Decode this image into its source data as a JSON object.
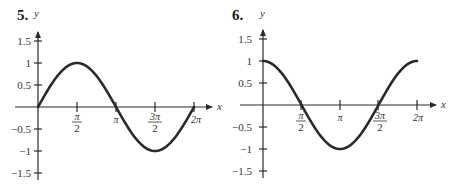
{
  "chart_data": [
    {
      "type": "line",
      "problem_number": "5.",
      "title": "",
      "xlabel": "x",
      "ylabel": "y",
      "x_ticks": [
        "π/2",
        "π",
        "3π/2",
        "2π"
      ],
      "x_tick_values": [
        1.5708,
        3.1416,
        4.7124,
        6.2832
      ],
      "y_ticks": [
        "1.5",
        "1",
        "0.5",
        "−0.5",
        "−1",
        "−1.5"
      ],
      "y_tick_values": [
        1.5,
        1,
        0.5,
        -0.5,
        -1,
        -1.5
      ],
      "xlim": [
        0,
        6.2832
      ],
      "ylim": [
        -1.5,
        1.5
      ],
      "function": "sin(x)",
      "series": [
        {
          "name": "y = sin x",
          "x": [
            0,
            0.7854,
            1.5708,
            2.3562,
            3.1416,
            3.927,
            4.7124,
            5.4978,
            6.2832
          ],
          "values": [
            0,
            0.707,
            1,
            0.707,
            0,
            -0.707,
            -1,
            -0.707,
            0
          ]
        }
      ],
      "grid": false
    },
    {
      "type": "line",
      "problem_number": "6.",
      "title": "",
      "xlabel": "x",
      "ylabel": "y",
      "x_ticks": [
        "π/2",
        "π",
        "3π/2",
        "2π"
      ],
      "x_tick_values": [
        1.5708,
        3.1416,
        4.7124,
        6.2832
      ],
      "y_ticks": [
        "1.5",
        "1",
        "0.5",
        "−0.5",
        "−1",
        "−1.5"
      ],
      "y_tick_values": [
        1.5,
        1,
        0.5,
        -0.5,
        -1,
        -1.5
      ],
      "xlim": [
        0,
        6.2832
      ],
      "ylim": [
        -1.5,
        1.5
      ],
      "function": "cos(x)",
      "series": [
        {
          "name": "y = cos x",
          "x": [
            0,
            0.7854,
            1.5708,
            2.3562,
            3.1416,
            3.927,
            4.7124,
            5.4978,
            6.2832
          ],
          "values": [
            1,
            0.707,
            0,
            -0.707,
            -1,
            -0.707,
            0,
            0.707,
            1
          ]
        }
      ],
      "grid": false
    }
  ],
  "graphs": [
    {
      "number": "5.",
      "y_label": "y",
      "x_label": "x",
      "y_tick_labels": [
        "1.5",
        "1",
        "0.5",
        "−0.5",
        "−1",
        "−1.5"
      ],
      "x_tick_labels": {
        "half_pi_num": "π",
        "half_pi_den": "2",
        "pi": "π",
        "three_half_pi_num": "3π",
        "three_half_pi_den": "2",
        "two_pi": "2π"
      }
    },
    {
      "number": "6.",
      "y_label": "y",
      "x_label": "x",
      "y_tick_labels": [
        "1.5",
        "1",
        "0.5",
        "−0.5",
        "−1",
        "−1.5"
      ],
      "x_tick_labels": {
        "half_pi_num": "π",
        "half_pi_den": "2",
        "pi": "π",
        "three_half_pi_num": "3π",
        "three_half_pi_den": "2",
        "two_pi": "2π"
      }
    }
  ]
}
